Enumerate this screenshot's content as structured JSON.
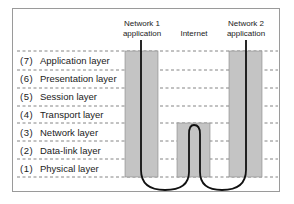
{
  "columns": [
    {
      "label_line1": "Network 1",
      "label_line2": "application"
    },
    {
      "label_line1": "Internet",
      "label_line2": ""
    },
    {
      "label_line1": "Network 2",
      "label_line2": "application"
    }
  ],
  "layers": [
    {
      "num": "(7)",
      "name": "Application layer"
    },
    {
      "num": "(6)",
      "name": "Presentation layer"
    },
    {
      "num": "(5)",
      "name": "Session layer"
    },
    {
      "num": "(4)",
      "name": "Transport layer"
    },
    {
      "num": "(3)",
      "name": "Network layer"
    },
    {
      "num": "(2)",
      "name": "Data-link layer"
    },
    {
      "num": "(1)",
      "name": "Physical layer"
    }
  ],
  "colors": {
    "box_fill": "#c4c4c4",
    "box_stroke": "#888888",
    "line": "#111111",
    "dash": "#666666"
  }
}
